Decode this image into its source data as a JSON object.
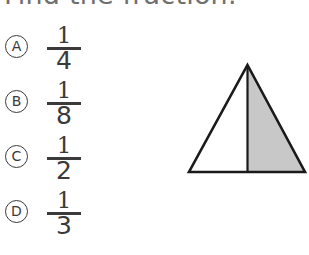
{
  "question": {
    "prompt": "Find the fraction."
  },
  "choices": [
    {
      "letter": "A",
      "numerator": "1",
      "denominator": "4",
      "fraction": "1/4"
    },
    {
      "letter": "B",
      "numerator": "1",
      "denominator": "8",
      "fraction": "1/8"
    },
    {
      "letter": "C",
      "numerator": "1",
      "denominator": "2",
      "fraction": "1/2"
    },
    {
      "letter": "D",
      "numerator": "1",
      "denominator": "3",
      "fraction": "1/3"
    }
  ],
  "figure": {
    "name": "triangle-split-in-half",
    "shape": "triangle",
    "parts_total": 2,
    "parts_shaded": 1,
    "shaded_side": "right",
    "divider": "vertical-median-line",
    "outline_color": "#1a1a1a",
    "shaded_fill_color": "#c8c8c8",
    "unshaded_fill_color": "#ffffff"
  },
  "colors": {
    "background": "#ffffff",
    "title_text": "#6f6f6f",
    "choice_text": "#3a3a3a",
    "figure_outline": "#1a1a1a",
    "figure_shade": "#c8c8c8"
  }
}
